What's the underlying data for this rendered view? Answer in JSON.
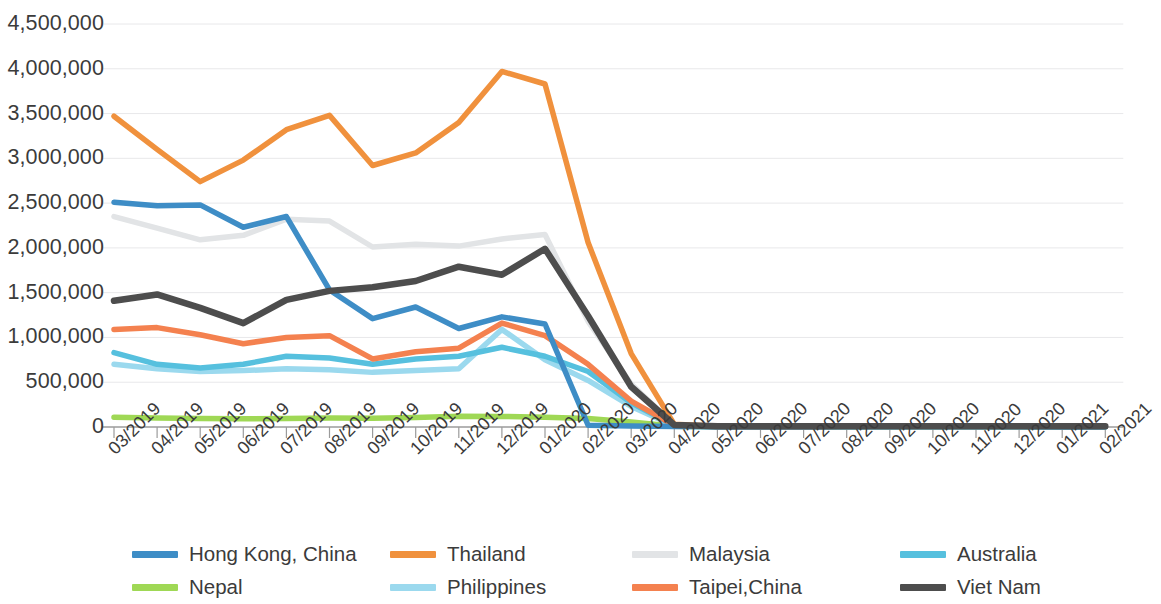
{
  "chart_data": {
    "type": "line",
    "title": "",
    "subtitle": "",
    "xlabel": "",
    "ylabel": "",
    "grid": true,
    "legend_position": "bottom",
    "ylim": [
      0,
      4500000
    ],
    "ytick_labels": [
      "4,500,000",
      "4,000,000",
      "3,500,000",
      "3,000,000",
      "2,500,000",
      "2,000,000",
      "1,500,000",
      "1,000,000",
      "500,000",
      "0"
    ],
    "ytick_values": [
      4500000,
      4000000,
      3500000,
      3000000,
      2500000,
      2000000,
      1500000,
      1000000,
      500000,
      0
    ],
    "categories": [
      "03/2019",
      "04/2019",
      "05/2019",
      "06/2019",
      "07/2019",
      "08/2019",
      "09/2019",
      "10/2019",
      "11/2019",
      "12/2019",
      "01/2020",
      "02/2020",
      "03/2020",
      "04/2020",
      "05/2020",
      "06/2020",
      "07/2020",
      "08/2020",
      "09/2020",
      "10/2020",
      "11/2020",
      "12/2020",
      "01/2021",
      "02/2021"
    ],
    "series": [
      {
        "name": "Hong Kong, China",
        "color": "#3e8dc6",
        "width": 5.5,
        "values": [
          2510000,
          2470000,
          2480000,
          2230000,
          2350000,
          1530000,
          1210000,
          1340000,
          1100000,
          1230000,
          1150000,
          20000,
          10000,
          5000,
          4000,
          4000,
          4000,
          5000,
          5000,
          5000,
          5000,
          5000,
          4000,
          4000
        ]
      },
      {
        "name": "Thailand",
        "color": "#f0913d",
        "width": 5.5,
        "values": [
          3470000,
          3100000,
          2740000,
          2980000,
          3320000,
          3480000,
          2920000,
          3060000,
          3400000,
          3970000,
          3830000,
          2060000,
          820000,
          30000,
          8000,
          6000,
          6000,
          7000,
          7000,
          7000,
          7000,
          7000,
          7000,
          6000
        ]
      },
      {
        "name": "Malaysia",
        "color": "#e2e4e6",
        "width": 5.5,
        "values": [
          2350000,
          2220000,
          2090000,
          2140000,
          2320000,
          2300000,
          2010000,
          2040000,
          2020000,
          2100000,
          2150000,
          1180000,
          480000,
          20000,
          7000,
          6000,
          6000,
          6000,
          6000,
          6000,
          6000,
          6000,
          6000,
          6000
        ]
      },
      {
        "name": "Australia",
        "color": "#56c0de",
        "width": 5.5,
        "values": [
          830000,
          700000,
          660000,
          700000,
          790000,
          770000,
          700000,
          760000,
          790000,
          890000,
          790000,
          620000,
          270000,
          15000,
          5000,
          4000,
          4000,
          5000,
          5000,
          5000,
          5000,
          5000,
          4000,
          4000
        ]
      },
      {
        "name": "Nepal",
        "color": "#9fd855",
        "width": 5.5,
        "values": [
          110000,
          100000,
          95000,
          92000,
          95000,
          100000,
          97000,
          105000,
          120000,
          118000,
          110000,
          95000,
          55000,
          8000,
          2000,
          2000,
          2000,
          2000,
          2000,
          2000,
          2000,
          2000,
          2000,
          2000
        ]
      },
      {
        "name": "Philippines",
        "color": "#9bd9ee",
        "width": 5.5,
        "values": [
          700000,
          650000,
          620000,
          630000,
          650000,
          640000,
          610000,
          630000,
          650000,
          1090000,
          750000,
          520000,
          230000,
          12000,
          4000,
          4000,
          4000,
          4000,
          4000,
          4000,
          4000,
          4000,
          4000,
          4000
        ]
      },
      {
        "name": "Taipei,China",
        "color": "#f4814f",
        "width": 5.5,
        "values": [
          1090000,
          1110000,
          1030000,
          930000,
          1000000,
          1020000,
          760000,
          840000,
          880000,
          1160000,
          1020000,
          700000,
          290000,
          18000,
          6000,
          6000,
          6000,
          8000,
          8000,
          8000,
          8000,
          8000,
          7000,
          7000
        ]
      },
      {
        "name": "Viet Nam",
        "color": "#4d4d4d",
        "width": 6.5,
        "values": [
          1410000,
          1480000,
          1330000,
          1160000,
          1420000,
          1520000,
          1560000,
          1630000,
          1790000,
          1700000,
          1990000,
          1240000,
          450000,
          22000,
          8000,
          8000,
          8000,
          9000,
          9000,
          9000,
          9000,
          9000,
          8000,
          8000
        ]
      }
    ]
  },
  "legend": {
    "items": [
      {
        "label": "Hong Kong, China",
        "color": "#3e8dc6"
      },
      {
        "label": "Thailand",
        "color": "#f0913d"
      },
      {
        "label": "Malaysia",
        "color": "#e2e4e6"
      },
      {
        "label": "Australia",
        "color": "#56c0de"
      },
      {
        "label": "Nepal",
        "color": "#9fd855"
      },
      {
        "label": "Philippines",
        "color": "#9bd9ee"
      },
      {
        "label": "Taipei,China",
        "color": "#f4814f"
      },
      {
        "label": "Viet Nam",
        "color": "#4d4d4d"
      }
    ]
  },
  "axis": {
    "line_color": "#9b9b9b",
    "grid_color": "#e8e8ea",
    "text_color": "#3b3b3b"
  }
}
